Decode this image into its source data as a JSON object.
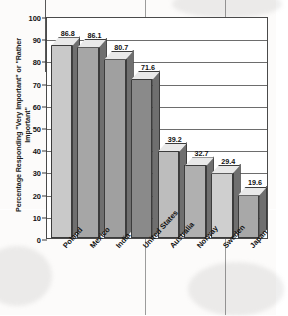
{
  "chart_data": {
    "type": "bar",
    "title": "",
    "subtitle": "",
    "xlabel": "",
    "ylabel": "Percentage Responding \"Very Important\" or \"Rather Important\"",
    "ylim": [
      0,
      100
    ],
    "ytick_step": 10,
    "yticks": [
      "100",
      "90",
      "80",
      "70",
      "60",
      "50",
      "40",
      "30",
      "20",
      "10",
      "0"
    ],
    "grid": "horizontal",
    "legend": "none",
    "style": "3d-bar",
    "categories": [
      "Poland",
      "Mexico",
      "India",
      "United States",
      "Australia",
      "Norway",
      "Sweden",
      "Japan"
    ],
    "values": [
      86.8,
      86.1,
      80.7,
      71.6,
      39.2,
      32.7,
      29.4,
      19.6
    ],
    "value_labels": [
      "86.8",
      "86.1",
      "80.7",
      "71.6",
      "39.2",
      "32.7",
      "29.4",
      "19.6"
    ],
    "bar_colors": [
      "#c9c9c9",
      "#a6a6a6",
      "#a0a0a0",
      "#8a8a8a",
      "#bdbdbd",
      "#b0b0b0",
      "#cfcfcf",
      "#a8a8a8"
    ],
    "bar_top_color": "#e9e9e9",
    "bar_side_color": "#6f6f6f",
    "axis_color": "#4a4a4a",
    "grid_color": "#6d6d6d",
    "text_color": "#121212",
    "background_color": "#fdfdfc"
  }
}
